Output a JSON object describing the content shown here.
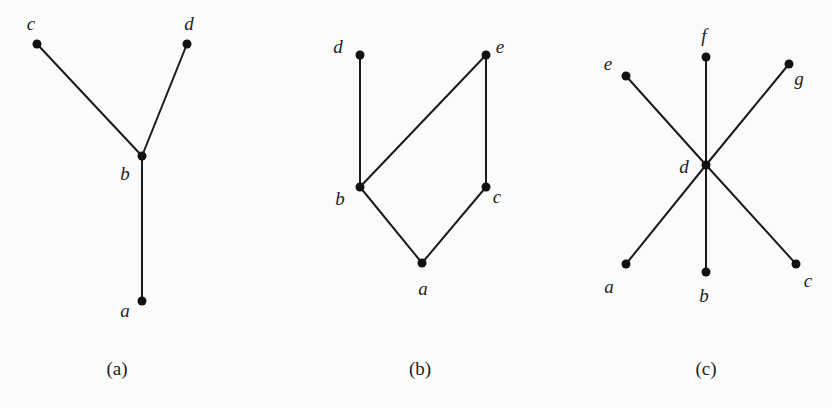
{
  "figures": [
    {
      "caption": "(a)",
      "caption_pos": [
        117,
        375
      ],
      "nodes": [
        {
          "id": "c",
          "label": "c",
          "x": 37,
          "y": 44,
          "lx": 31,
          "ly": 30
        },
        {
          "id": "d",
          "label": "d",
          "x": 187,
          "y": 44,
          "lx": 189,
          "ly": 30
        },
        {
          "id": "b",
          "label": "b",
          "x": 142,
          "y": 156,
          "lx": 125,
          "ly": 180
        },
        {
          "id": "a",
          "label": "a",
          "x": 142,
          "y": 301,
          "lx": 125,
          "ly": 317
        }
      ],
      "edges": [
        [
          "c",
          "b"
        ],
        [
          "d",
          "b"
        ],
        [
          "b",
          "a"
        ]
      ]
    },
    {
      "caption": "(b)",
      "caption_pos": [
        420,
        375
      ],
      "nodes": [
        {
          "id": "d",
          "label": "d",
          "x": 360,
          "y": 55,
          "lx": 338,
          "ly": 53
        },
        {
          "id": "e",
          "label": "e",
          "x": 486,
          "y": 55,
          "lx": 500,
          "ly": 53
        },
        {
          "id": "b",
          "label": "b",
          "x": 360,
          "y": 187,
          "lx": 340,
          "ly": 205
        },
        {
          "id": "c",
          "label": "c",
          "x": 486,
          "y": 187,
          "lx": 497,
          "ly": 203
        },
        {
          "id": "a",
          "label": "a",
          "x": 422,
          "y": 263,
          "lx": 423,
          "ly": 295
        }
      ],
      "edges": [
        [
          "d",
          "b"
        ],
        [
          "b",
          "e"
        ],
        [
          "e",
          "c"
        ],
        [
          "b",
          "a"
        ],
        [
          "c",
          "a"
        ]
      ]
    },
    {
      "caption": "(c)",
      "caption_pos": [
        706,
        375
      ],
      "nodes": [
        {
          "id": "f",
          "label": "f",
          "x": 706,
          "y": 57,
          "lx": 704,
          "ly": 42
        },
        {
          "id": "e",
          "label": "e",
          "x": 626,
          "y": 76,
          "lx": 608,
          "ly": 70
        },
        {
          "id": "g",
          "label": "g",
          "x": 789,
          "y": 64,
          "lx": 799,
          "ly": 85
        },
        {
          "id": "d",
          "label": "d",
          "x": 706,
          "y": 165,
          "lx": 684,
          "ly": 173
        },
        {
          "id": "a",
          "label": "a",
          "x": 626,
          "y": 264,
          "lx": 609,
          "ly": 293
        },
        {
          "id": "b",
          "label": "b",
          "x": 706,
          "y": 272,
          "lx": 704,
          "ly": 302
        },
        {
          "id": "c",
          "label": "c",
          "x": 796,
          "y": 264,
          "lx": 808,
          "ly": 287
        }
      ],
      "edges": [
        [
          "e",
          "d"
        ],
        [
          "f",
          "d"
        ],
        [
          "g",
          "d"
        ],
        [
          "d",
          "a"
        ],
        [
          "d",
          "b"
        ],
        [
          "d",
          "c"
        ]
      ]
    }
  ]
}
